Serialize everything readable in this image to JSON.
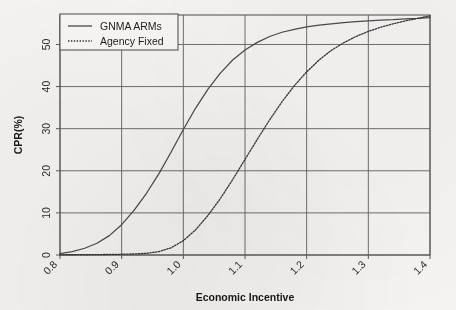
{
  "chart_data": {
    "type": "line",
    "title": "",
    "subtitle": "",
    "xlabel": "Economic Incentive",
    "ylabel": "CPR(%)",
    "xlim": [
      0.8,
      1.4
    ],
    "ylim": [
      0,
      57
    ],
    "xticks": [
      "0.8",
      "0.9",
      "1.0",
      "1.1",
      "1.2",
      "1.3",
      "1.4"
    ],
    "xtick_values": [
      0.8,
      0.9,
      1.0,
      1.1,
      1.2,
      1.3,
      1.4
    ],
    "yticks": [
      "0",
      "10",
      "20",
      "30",
      "40",
      "50"
    ],
    "ytick_values": [
      0,
      10,
      20,
      30,
      40,
      50
    ],
    "grid": true,
    "legend_position": "top-left",
    "x": [
      0.8,
      0.82,
      0.84,
      0.86,
      0.88,
      0.9,
      0.92,
      0.94,
      0.96,
      0.98,
      1.0,
      1.02,
      1.04,
      1.06,
      1.08,
      1.1,
      1.12,
      1.14,
      1.16,
      1.18,
      1.2,
      1.22,
      1.24,
      1.26,
      1.28,
      1.3,
      1.32,
      1.34,
      1.36,
      1.38,
      1.4
    ],
    "series": [
      {
        "name": "GNMA ARMs",
        "style": "solid",
        "color": "#4a4a4c",
        "values": [
          0.3,
          0.8,
          1.6,
          2.8,
          4.6,
          7.2,
          10.6,
          14.6,
          19.2,
          24.4,
          29.8,
          34.9,
          39.4,
          43.2,
          46.3,
          48.7,
          50.5,
          51.9,
          52.9,
          53.6,
          54.2,
          54.6,
          54.9,
          55.2,
          55.4,
          55.6,
          55.8,
          55.9,
          56.1,
          56.2,
          56.4
        ]
      },
      {
        "name": "Agency Fixed",
        "style": "dotted",
        "color": "#333335",
        "values": [
          0.05,
          0.06,
          0.08,
          0.1,
          0.13,
          0.18,
          0.25,
          0.4,
          0.8,
          1.7,
          3.4,
          6.0,
          9.4,
          13.4,
          17.9,
          22.7,
          27.5,
          32.1,
          36.4,
          40.2,
          43.5,
          46.3,
          48.6,
          50.4,
          51.9,
          53.1,
          54.1,
          54.9,
          55.6,
          56.2,
          56.8
        ]
      }
    ],
    "legend": [
      {
        "label": "GNMA ARMs",
        "style": "solid"
      },
      {
        "label": "Agency Fixed",
        "style": "dotted"
      }
    ],
    "colors": {
      "background": "#f4f3f1",
      "grid": "#6d6d6f",
      "axis": "#58585a",
      "text": "#1d1d1f"
    }
  }
}
